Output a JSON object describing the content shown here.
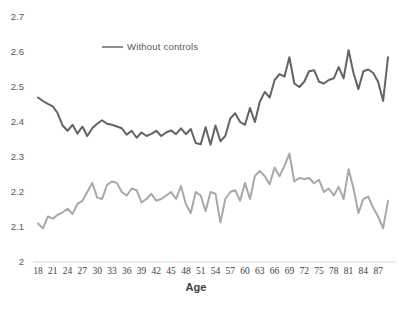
{
  "chart_data": {
    "type": "line",
    "title": "",
    "xlabel": "Age",
    "ylabel": "",
    "xlim": [
      18,
      89
    ],
    "ylim": [
      2,
      2.7
    ],
    "grid": false,
    "axis_line_color": "#d9d9d9",
    "y_tick_label_color": "#595959",
    "x_tick_label_color": "#404040",
    "y_ticks": [
      2,
      2.1,
      2.2,
      2.3,
      2.4,
      2.5,
      2.6,
      2.7
    ],
    "x_ticks": [
      18,
      21,
      24,
      27,
      30,
      33,
      36,
      39,
      42,
      45,
      48,
      51,
      54,
      57,
      60,
      63,
      66,
      69,
      72,
      75,
      78,
      81,
      84,
      87
    ],
    "legend": {
      "label": "Without controls",
      "position": "top-center",
      "color": "#8e8e8e"
    },
    "x": [
      18,
      19,
      20,
      21,
      22,
      23,
      24,
      25,
      26,
      27,
      28,
      29,
      30,
      31,
      32,
      33,
      34,
      35,
      36,
      37,
      38,
      39,
      40,
      41,
      42,
      43,
      44,
      45,
      46,
      47,
      48,
      49,
      50,
      51,
      52,
      53,
      54,
      55,
      56,
      57,
      58,
      59,
      60,
      61,
      62,
      63,
      64,
      65,
      66,
      67,
      68,
      69,
      70,
      71,
      72,
      73,
      74,
      75,
      76,
      77,
      78,
      79,
      80,
      81,
      82,
      83,
      84,
      85,
      86,
      87,
      88,
      89
    ],
    "series": [
      {
        "name": "Without controls",
        "color": "#636363",
        "values": [
          2.47,
          2.46,
          2.452,
          2.445,
          2.425,
          2.39,
          2.375,
          2.392,
          2.367,
          2.387,
          2.36,
          2.382,
          2.395,
          2.405,
          2.395,
          2.392,
          2.387,
          2.382,
          2.364,
          2.375,
          2.355,
          2.37,
          2.36,
          2.366,
          2.375,
          2.36,
          2.37,
          2.376,
          2.365,
          2.382,
          2.365,
          2.38,
          2.34,
          2.336,
          2.385,
          2.335,
          2.39,
          2.345,
          2.36,
          2.41,
          2.425,
          2.4,
          2.392,
          2.44,
          2.4,
          2.458,
          2.486,
          2.47,
          2.52,
          2.537,
          2.53,
          2.585,
          2.51,
          2.5,
          2.515,
          2.545,
          2.548,
          2.515,
          2.51,
          2.52,
          2.525,
          2.557,
          2.525,
          2.605,
          2.54,
          2.494,
          2.545,
          2.55,
          2.54,
          2.515,
          2.46,
          2.585
        ]
      },
      {
        "name": "",
        "color": "#a8a8a8",
        "values": [
          2.11,
          2.096,
          2.13,
          2.124,
          2.135,
          2.142,
          2.152,
          2.137,
          2.166,
          2.175,
          2.2,
          2.226,
          2.184,
          2.18,
          2.22,
          2.23,
          2.226,
          2.2,
          2.19,
          2.21,
          2.205,
          2.17,
          2.18,
          2.195,
          2.175,
          2.18,
          2.19,
          2.2,
          2.18,
          2.217,
          2.165,
          2.14,
          2.2,
          2.19,
          2.145,
          2.2,
          2.195,
          2.113,
          2.18,
          2.2,
          2.205,
          2.175,
          2.226,
          2.18,
          2.246,
          2.26,
          2.245,
          2.222,
          2.27,
          2.245,
          2.275,
          2.31,
          2.23,
          2.24,
          2.237,
          2.24,
          2.225,
          2.235,
          2.2,
          2.21,
          2.19,
          2.215,
          2.18,
          2.265,
          2.21,
          2.14,
          2.18,
          2.187,
          2.155,
          2.13,
          2.096,
          2.175
        ]
      }
    ]
  }
}
